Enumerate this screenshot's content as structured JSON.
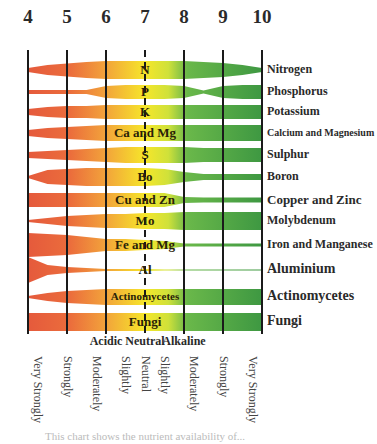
{
  "chart_data": {
    "type": "area",
    "xlabel": "pH",
    "x_ticks": [
      4,
      5,
      6,
      7,
      8,
      9,
      10
    ],
    "xlim": [
      4,
      10
    ],
    "grid": true,
    "color_scale": {
      "acidic": "#e8553a",
      "mid": "#f5a83a",
      "neutral": "#f6e92a",
      "alkaline": "#5cb44a",
      "strong_alkaline": "#3f9a40"
    },
    "zones": [
      {
        "label": "Acidic",
        "x": 6
      },
      {
        "label": "Neutral",
        "x": 7
      },
      {
        "label": "Alkaline",
        "x": 8
      }
    ],
    "scale_labels": [
      "Very Strongly",
      "Strongly",
      "Moderately",
      "Slightly",
      "Neutral",
      "Slightly",
      "Moderately",
      "Strongly",
      "Very Strongly"
    ],
    "scale_label_positions": [
      4.25,
      5,
      5.75,
      6.5,
      7,
      7.5,
      8.25,
      9,
      9.75
    ],
    "x_samples": [
      4,
      4.5,
      5,
      5.5,
      6,
      6.5,
      7,
      7.5,
      8,
      8.5,
      9,
      9.5,
      10
    ],
    "series": [
      {
        "name": "Nitrogen",
        "band_label": "N",
        "center_y": 70,
        "thickness": [
          4,
          10,
          13,
          16,
          18,
          18,
          18,
          18,
          18,
          16,
          14,
          10,
          4
        ]
      },
      {
        "name": "Phosphorus",
        "band_label": "P",
        "center_y": 92,
        "thickness": [
          4,
          4,
          4,
          4,
          12,
          14,
          14,
          14,
          12,
          3,
          12,
          14,
          14
        ]
      },
      {
        "name": "Potassium",
        "band_label": "K",
        "center_y": 112,
        "thickness": [
          6,
          10,
          12,
          12,
          14,
          14,
          14,
          14,
          14,
          14,
          14,
          14,
          14
        ]
      },
      {
        "name": "Calcium and Magnesium",
        "band_label": "Ca and Mg",
        "center_y": 133,
        "thickness": [
          6,
          10,
          12,
          14,
          16,
          16,
          16,
          16,
          16,
          16,
          16,
          16,
          16
        ]
      },
      {
        "name": "Sulphur",
        "band_label": "S",
        "center_y": 155,
        "thickness": [
          6,
          8,
          10,
          12,
          14,
          16,
          16,
          16,
          16,
          14,
          14,
          14,
          14
        ]
      },
      {
        "name": "Boron",
        "band_label": "Bo",
        "center_y": 177,
        "thickness": [
          2,
          14,
          16,
          18,
          18,
          18,
          18,
          16,
          10,
          6,
          6,
          6,
          6
        ]
      },
      {
        "name": "Copper and Zinc",
        "band_label": "Cu and Zn",
        "center_y": 200,
        "thickness": [
          14,
          14,
          14,
          14,
          14,
          14,
          14,
          14,
          6,
          5,
          5,
          5,
          5
        ]
      },
      {
        "name": "Molybdenum",
        "band_label": "Mo",
        "center_y": 221,
        "thickness": [
          2,
          6,
          10,
          12,
          14,
          14,
          16,
          16,
          18,
          18,
          18,
          18,
          18
        ]
      },
      {
        "name": "Iron and Manganese",
        "band_label": "Fe and Mg",
        "center_y": 245,
        "thickness": [
          24,
          22,
          20,
          16,
          12,
          12,
          10,
          8,
          3,
          3,
          3,
          3,
          3
        ]
      },
      {
        "name": "Aluminium",
        "band_label": "Al",
        "center_y": 270,
        "thickness": [
          26,
          10,
          6,
          4,
          2,
          2,
          2,
          1,
          1,
          1,
          1,
          1,
          1
        ]
      },
      {
        "name": "Actinomycetes",
        "band_label": "Actinomycetes",
        "center_y": 297,
        "thickness": [
          2,
          8,
          12,
          14,
          16,
          16,
          16,
          16,
          16,
          16,
          16,
          16,
          16
        ]
      },
      {
        "name": "Fungi",
        "band_label": "Fungi",
        "center_y": 322,
        "thickness": [
          18,
          18,
          18,
          18,
          18,
          18,
          18,
          18,
          18,
          18,
          18,
          18,
          18
        ]
      }
    ],
    "row_label_font_sizes": [
      12,
      12,
      12,
      10,
      12,
      12,
      13,
      12,
      12,
      14,
      14,
      14
    ]
  },
  "caption": "This chart shows the nutrient availability of..."
}
